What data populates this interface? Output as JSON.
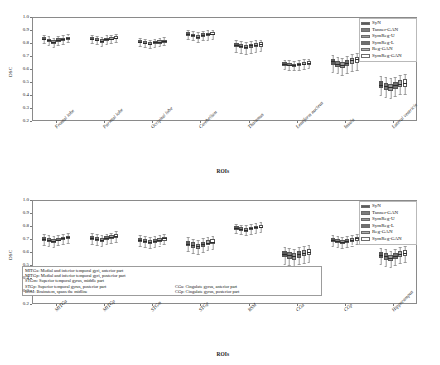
{
  "figure": {
    "y_axis_label": "DSC",
    "x_axis_label": "ROIs",
    "y_ticks": [
      "1.0",
      "0.9",
      "0.8",
      "0.7",
      "0.6",
      "0.5",
      "0.4",
      "0.3",
      "0.2"
    ],
    "ylim": [
      0.2,
      1.0
    ]
  },
  "legend": {
    "items": [
      {
        "label": "SyN",
        "color": "#5a5a5a"
      },
      {
        "label": "Tanner-GAN",
        "color": "#7d7d7d"
      },
      {
        "label": "SymReg-U",
        "color": "#9a9a9a"
      },
      {
        "label": "SymReg-L",
        "color": "#6e6e6e"
      },
      {
        "label": "Reg-GAN",
        "color": "#b0b0b0"
      },
      {
        "label": "SymReg-GAN",
        "color": "#ffffff"
      }
    ]
  },
  "footnote": {
    "rows": [
      {
        "key": "MITGa:",
        "text": "Medial and inferior temporal gyri,  anterior part"
      },
      {
        "key": "MITGp:",
        "text": "Medial and inferior temporal gyri,  posterior part"
      },
      {
        "key": "STGm:",
        "text": "Superior temporal gyrus,  middle part"
      },
      {
        "key": "STGp:",
        "text": "Superior temporal gyrus,  posterior part"
      },
      {
        "key": "BSM:",
        "text": "Brainstem,  spans the midline"
      }
    ],
    "rows_right": [
      {
        "key": "CGa:",
        "text": "Cingulate gyrus,  anterior part"
      },
      {
        "key": "CGp:",
        "text": "Cingulate gyrus,  posterior part"
      }
    ]
  },
  "chart_data": [
    {
      "type": "box",
      "panel": "top",
      "title": "",
      "xlabel": "ROIs",
      "ylabel": "DSC",
      "ylim": [
        0.2,
        1.0
      ],
      "grid": false,
      "legend_position": "top-right",
      "categories": [
        "Frontal lobe",
        "Parietal lobe",
        "Occipital lobe",
        "Cerebellum",
        "Thalamus",
        "Lentiform nucleus",
        "Insula",
        "Lateral ventricle"
      ],
      "series": [
        {
          "name": "SyN",
          "boxes": [
            {
              "q1": 0.82,
              "med": 0.832,
              "q3": 0.843,
              "lo": 0.8,
              "hi": 0.862
            },
            {
              "q1": 0.822,
              "med": 0.834,
              "q3": 0.845,
              "lo": 0.802,
              "hi": 0.864
            },
            {
              "q1": 0.798,
              "med": 0.81,
              "q3": 0.82,
              "lo": 0.778,
              "hi": 0.84
            },
            {
              "q1": 0.856,
              "med": 0.87,
              "q3": 0.882,
              "lo": 0.83,
              "hi": 0.9
            },
            {
              "q1": 0.768,
              "med": 0.786,
              "q3": 0.8,
              "lo": 0.73,
              "hi": 0.82
            },
            {
              "q1": 0.626,
              "med": 0.64,
              "q3": 0.652,
              "lo": 0.6,
              "hi": 0.672
            },
            {
              "q1": 0.632,
              "med": 0.658,
              "q3": 0.678,
              "lo": 0.58,
              "hi": 0.706
            },
            {
              "q1": 0.452,
              "med": 0.48,
              "q3": 0.505,
              "lo": 0.4,
              "hi": 0.548
            }
          ]
        },
        {
          "name": "Tanner-GAN",
          "boxes": [
            {
              "q1": 0.806,
              "med": 0.82,
              "q3": 0.832,
              "lo": 0.784,
              "hi": 0.852
            },
            {
              "q1": 0.812,
              "med": 0.826,
              "q3": 0.838,
              "lo": 0.79,
              "hi": 0.856
            },
            {
              "q1": 0.79,
              "med": 0.802,
              "q3": 0.814,
              "lo": 0.77,
              "hi": 0.832
            },
            {
              "q1": 0.846,
              "med": 0.86,
              "q3": 0.872,
              "lo": 0.82,
              "hi": 0.892
            },
            {
              "q1": 0.762,
              "med": 0.78,
              "q3": 0.794,
              "lo": 0.724,
              "hi": 0.816
            },
            {
              "q1": 0.62,
              "med": 0.634,
              "q3": 0.646,
              "lo": 0.596,
              "hi": 0.666
            },
            {
              "q1": 0.618,
              "med": 0.642,
              "q3": 0.664,
              "lo": 0.566,
              "hi": 0.694
            },
            {
              "q1": 0.44,
              "med": 0.468,
              "q3": 0.494,
              "lo": 0.388,
              "hi": 0.536
            }
          ]
        },
        {
          "name": "SymReg-U",
          "boxes": [
            {
              "q1": 0.796,
              "med": 0.81,
              "q3": 0.822,
              "lo": 0.772,
              "hi": 0.842
            },
            {
              "q1": 0.802,
              "med": 0.816,
              "q3": 0.828,
              "lo": 0.78,
              "hi": 0.848
            },
            {
              "q1": 0.782,
              "med": 0.796,
              "q3": 0.808,
              "lo": 0.762,
              "hi": 0.826
            },
            {
              "q1": 0.832,
              "med": 0.848,
              "q3": 0.862,
              "lo": 0.806,
              "hi": 0.882
            },
            {
              "q1": 0.754,
              "med": 0.772,
              "q3": 0.788,
              "lo": 0.716,
              "hi": 0.81
            },
            {
              "q1": 0.616,
              "med": 0.63,
              "q3": 0.642,
              "lo": 0.59,
              "hi": 0.662
            },
            {
              "q1": 0.608,
              "med": 0.632,
              "q3": 0.656,
              "lo": 0.556,
              "hi": 0.686
            },
            {
              "q1": 0.43,
              "med": 0.458,
              "q3": 0.486,
              "lo": 0.376,
              "hi": 0.528
            }
          ]
        },
        {
          "name": "SymReg-L",
          "boxes": [
            {
              "q1": 0.81,
              "med": 0.824,
              "q3": 0.836,
              "lo": 0.788,
              "hi": 0.856
            },
            {
              "q1": 0.816,
              "med": 0.83,
              "q3": 0.842,
              "lo": 0.794,
              "hi": 0.86
            },
            {
              "q1": 0.792,
              "med": 0.804,
              "q3": 0.816,
              "lo": 0.772,
              "hi": 0.834
            },
            {
              "q1": 0.848,
              "med": 0.862,
              "q3": 0.876,
              "lo": 0.822,
              "hi": 0.894
            },
            {
              "q1": 0.764,
              "med": 0.782,
              "q3": 0.796,
              "lo": 0.726,
              "hi": 0.818
            },
            {
              "q1": 0.622,
              "med": 0.636,
              "q3": 0.648,
              "lo": 0.596,
              "hi": 0.668
            },
            {
              "q1": 0.624,
              "med": 0.648,
              "q3": 0.67,
              "lo": 0.572,
              "hi": 0.7
            },
            {
              "q1": 0.446,
              "med": 0.474,
              "q3": 0.5,
              "lo": 0.392,
              "hi": 0.542
            }
          ]
        },
        {
          "name": "Reg-GAN",
          "boxes": [
            {
              "q1": 0.814,
              "med": 0.828,
              "q3": 0.84,
              "lo": 0.792,
              "hi": 0.86
            },
            {
              "q1": 0.82,
              "med": 0.834,
              "q3": 0.846,
              "lo": 0.798,
              "hi": 0.864
            },
            {
              "q1": 0.796,
              "med": 0.808,
              "q3": 0.82,
              "lo": 0.776,
              "hi": 0.838
            },
            {
              "q1": 0.852,
              "med": 0.866,
              "q3": 0.878,
              "lo": 0.826,
              "hi": 0.898
            },
            {
              "q1": 0.768,
              "med": 0.786,
              "q3": 0.8,
              "lo": 0.73,
              "hi": 0.822
            },
            {
              "q1": 0.628,
              "med": 0.642,
              "q3": 0.654,
              "lo": 0.602,
              "hi": 0.674
            },
            {
              "q1": 0.64,
              "med": 0.666,
              "q3": 0.688,
              "lo": 0.588,
              "hi": 0.716
            },
            {
              "q1": 0.458,
              "med": 0.486,
              "q3": 0.512,
              "lo": 0.404,
              "hi": 0.554
            }
          ]
        },
        {
          "name": "SymReg-GAN",
          "boxes": [
            {
              "q1": 0.826,
              "med": 0.84,
              "q3": 0.85,
              "lo": 0.806,
              "hi": 0.868
            },
            {
              "q1": 0.83,
              "med": 0.842,
              "q3": 0.854,
              "lo": 0.81,
              "hi": 0.872
            },
            {
              "q1": 0.802,
              "med": 0.814,
              "q3": 0.826,
              "lo": 0.782,
              "hi": 0.844
            },
            {
              "q1": 0.858,
              "med": 0.872,
              "q3": 0.884,
              "lo": 0.834,
              "hi": 0.902
            },
            {
              "q1": 0.772,
              "med": 0.79,
              "q3": 0.804,
              "lo": 0.736,
              "hi": 0.826
            },
            {
              "q1": 0.63,
              "med": 0.646,
              "q3": 0.658,
              "lo": 0.606,
              "hi": 0.678
            },
            {
              "q1": 0.648,
              "med": 0.674,
              "q3": 0.696,
              "lo": 0.596,
              "hi": 0.724
            },
            {
              "q1": 0.464,
              "med": 0.492,
              "q3": 0.52,
              "lo": 0.41,
              "hi": 0.562
            }
          ]
        }
      ]
    },
    {
      "type": "box",
      "panel": "bottom",
      "title": "",
      "xlabel": "ROIs",
      "ylabel": "DSC",
      "ylim": [
        0.2,
        1.0
      ],
      "grid": false,
      "legend_position": "top-right",
      "categories": [
        "MITGa",
        "MITGp",
        "STGm",
        "STGp",
        "BSM",
        "CGa",
        "CGp",
        "Hippocampus"
      ],
      "series": [
        {
          "name": "SyN",
          "boxes": [
            {
              "q1": 0.686,
              "med": 0.7,
              "q3": 0.714,
              "lo": 0.656,
              "hi": 0.738
            },
            {
              "q1": 0.694,
              "med": 0.71,
              "q3": 0.724,
              "lo": 0.664,
              "hi": 0.746
            },
            {
              "q1": 0.676,
              "med": 0.692,
              "q3": 0.706,
              "lo": 0.646,
              "hi": 0.73
            },
            {
              "q1": 0.644,
              "med": 0.664,
              "q3": 0.684,
              "lo": 0.606,
              "hi": 0.712
            },
            {
              "q1": 0.772,
              "med": 0.786,
              "q3": 0.798,
              "lo": 0.744,
              "hi": 0.818
            },
            {
              "q1": 0.56,
              "med": 0.586,
              "q3": 0.61,
              "lo": 0.51,
              "hi": 0.64
            },
            {
              "q1": 0.676,
              "med": 0.692,
              "q3": 0.706,
              "lo": 0.646,
              "hi": 0.73
            },
            {
              "q1": 0.552,
              "med": 0.576,
              "q3": 0.6,
              "lo": 0.506,
              "hi": 0.63
            }
          ]
        },
        {
          "name": "Tanner-GAN",
          "boxes": [
            {
              "q1": 0.678,
              "med": 0.692,
              "q3": 0.706,
              "lo": 0.648,
              "hi": 0.73
            },
            {
              "q1": 0.686,
              "med": 0.702,
              "q3": 0.716,
              "lo": 0.656,
              "hi": 0.738
            },
            {
              "q1": 0.668,
              "med": 0.684,
              "q3": 0.698,
              "lo": 0.638,
              "hi": 0.722
            },
            {
              "q1": 0.634,
              "med": 0.654,
              "q3": 0.674,
              "lo": 0.596,
              "hi": 0.702
            },
            {
              "q1": 0.764,
              "med": 0.778,
              "q3": 0.79,
              "lo": 0.736,
              "hi": 0.81
            },
            {
              "q1": 0.55,
              "med": 0.576,
              "q3": 0.6,
              "lo": 0.5,
              "hi": 0.63
            },
            {
              "q1": 0.668,
              "med": 0.684,
              "q3": 0.698,
              "lo": 0.638,
              "hi": 0.722
            },
            {
              "q1": 0.542,
              "med": 0.566,
              "q3": 0.59,
              "lo": 0.496,
              "hi": 0.62
            }
          ]
        },
        {
          "name": "SymReg-U",
          "boxes": [
            {
              "q1": 0.668,
              "med": 0.684,
              "q3": 0.698,
              "lo": 0.638,
              "hi": 0.722
            },
            {
              "q1": 0.676,
              "med": 0.692,
              "q3": 0.708,
              "lo": 0.646,
              "hi": 0.73
            },
            {
              "q1": 0.66,
              "med": 0.676,
              "q3": 0.69,
              "lo": 0.63,
              "hi": 0.714
            },
            {
              "q1": 0.624,
              "med": 0.644,
              "q3": 0.664,
              "lo": 0.586,
              "hi": 0.692
            },
            {
              "q1": 0.756,
              "med": 0.77,
              "q3": 0.784,
              "lo": 0.728,
              "hi": 0.804
            },
            {
              "q1": 0.54,
              "med": 0.566,
              "q3": 0.59,
              "lo": 0.49,
              "hi": 0.62
            },
            {
              "q1": 0.66,
              "med": 0.676,
              "q3": 0.69,
              "lo": 0.63,
              "hi": 0.714
            },
            {
              "q1": 0.532,
              "med": 0.556,
              "q3": 0.58,
              "lo": 0.486,
              "hi": 0.61
            }
          ]
        },
        {
          "name": "SymReg-L",
          "boxes": [
            {
              "q1": 0.682,
              "med": 0.696,
              "q3": 0.71,
              "lo": 0.652,
              "hi": 0.734
            },
            {
              "q1": 0.69,
              "med": 0.706,
              "q3": 0.72,
              "lo": 0.66,
              "hi": 0.742
            },
            {
              "q1": 0.672,
              "med": 0.688,
              "q3": 0.702,
              "lo": 0.642,
              "hi": 0.726
            },
            {
              "q1": 0.64,
              "med": 0.66,
              "q3": 0.68,
              "lo": 0.602,
              "hi": 0.708
            },
            {
              "q1": 0.768,
              "med": 0.782,
              "q3": 0.794,
              "lo": 0.74,
              "hi": 0.814
            },
            {
              "q1": 0.556,
              "med": 0.582,
              "q3": 0.606,
              "lo": 0.506,
              "hi": 0.636
            },
            {
              "q1": 0.672,
              "med": 0.688,
              "q3": 0.702,
              "lo": 0.642,
              "hi": 0.726
            },
            {
              "q1": 0.548,
              "med": 0.572,
              "q3": 0.596,
              "lo": 0.502,
              "hi": 0.626
            }
          ]
        },
        {
          "name": "Reg-GAN",
          "boxes": [
            {
              "q1": 0.69,
              "med": 0.704,
              "q3": 0.718,
              "lo": 0.66,
              "hi": 0.742
            },
            {
              "q1": 0.698,
              "med": 0.714,
              "q3": 0.728,
              "lo": 0.668,
              "hi": 0.75
            },
            {
              "q1": 0.68,
              "med": 0.696,
              "q3": 0.71,
              "lo": 0.65,
              "hi": 0.734
            },
            {
              "q1": 0.65,
              "med": 0.67,
              "q3": 0.69,
              "lo": 0.612,
              "hi": 0.718
            },
            {
              "q1": 0.776,
              "med": 0.79,
              "q3": 0.802,
              "lo": 0.748,
              "hi": 0.822
            },
            {
              "q1": 0.566,
              "med": 0.592,
              "q3": 0.616,
              "lo": 0.516,
              "hi": 0.646
            },
            {
              "q1": 0.68,
              "med": 0.696,
              "q3": 0.71,
              "lo": 0.65,
              "hi": 0.734
            },
            {
              "q1": 0.558,
              "med": 0.582,
              "q3": 0.606,
              "lo": 0.512,
              "hi": 0.636
            }
          ]
        },
        {
          "name": "SymReg-GAN",
          "boxes": [
            {
              "q1": 0.698,
              "med": 0.712,
              "q3": 0.726,
              "lo": 0.668,
              "hi": 0.75
            },
            {
              "q1": 0.706,
              "med": 0.722,
              "q3": 0.736,
              "lo": 0.676,
              "hi": 0.758
            },
            {
              "q1": 0.688,
              "med": 0.704,
              "q3": 0.718,
              "lo": 0.658,
              "hi": 0.742
            },
            {
              "q1": 0.658,
              "med": 0.678,
              "q3": 0.698,
              "lo": 0.62,
              "hi": 0.726
            },
            {
              "q1": 0.782,
              "med": 0.796,
              "q3": 0.808,
              "lo": 0.754,
              "hi": 0.828
            },
            {
              "q1": 0.574,
              "med": 0.6,
              "q3": 0.624,
              "lo": 0.524,
              "hi": 0.654
            },
            {
              "q1": 0.688,
              "med": 0.704,
              "q3": 0.718,
              "lo": 0.658,
              "hi": 0.742
            },
            {
              "q1": 0.566,
              "med": 0.59,
              "q3": 0.614,
              "lo": 0.52,
              "hi": 0.644
            }
          ]
        }
      ]
    }
  ]
}
